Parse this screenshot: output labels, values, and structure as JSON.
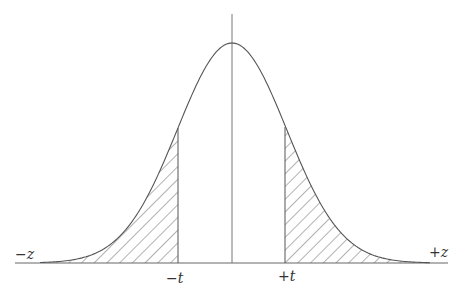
{
  "diagram": {
    "type": "normal-distribution-two-tailed",
    "labels": {
      "left_axis_end": "−z",
      "right_axis_end": "+z",
      "left_cutoff": "−t",
      "right_cutoff": "+t"
    },
    "shaded_regions": [
      "left-tail",
      "right-tail"
    ],
    "colors": {
      "ink": "#555555",
      "background": "#ffffff"
    }
  }
}
